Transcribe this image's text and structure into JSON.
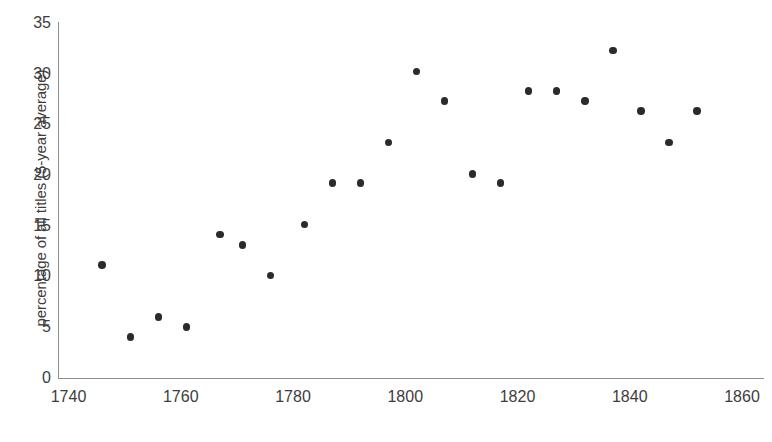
{
  "chart_data": {
    "type": "scatter",
    "title": "",
    "xlabel": "",
    "ylabel": "percentage of all titles (5-year average)",
    "xlim": [
      1740,
      1860
    ],
    "ylim": [
      0,
      35
    ],
    "xticks": [
      1740,
      1760,
      1780,
      1800,
      1820,
      1840,
      1860
    ],
    "xtick_labels": [
      "1740",
      "1760",
      "1780",
      "1800",
      "1820",
      "1840",
      "1860"
    ],
    "yticks": [
      0,
      5,
      10,
      15,
      20,
      25,
      30,
      35
    ],
    "ytick_labels": [
      "0",
      "5",
      "10",
      "15",
      "20",
      "25",
      "30",
      "35"
    ],
    "grid": false,
    "legend": false,
    "marker": "circle",
    "marker_color": "#2b2b2b",
    "axis_color": "#8e8e8e",
    "text_color": "#3d3d3d",
    "background": "#ffffff",
    "x": [
      1746,
      1751,
      1756,
      1761,
      1767,
      1771,
      1776,
      1782,
      1787,
      1792,
      1797,
      1802,
      1807,
      1812,
      1817,
      1822,
      1827,
      1832,
      1837,
      1842,
      1847,
      1852
    ],
    "y": [
      11.1,
      4.0,
      6.0,
      5.0,
      14.1,
      13.1,
      10.1,
      15.1,
      19.2,
      19.2,
      23.2,
      30.2,
      27.3,
      20.1,
      19.2,
      28.3,
      28.3,
      27.3,
      32.3,
      26.3,
      23.2,
      26.3
    ],
    "points": [
      {
        "x": 1746,
        "y": 11.1
      },
      {
        "x": 1751,
        "y": 4.0
      },
      {
        "x": 1756,
        "y": 6.0
      },
      {
        "x": 1761,
        "y": 5.0
      },
      {
        "x": 1767,
        "y": 14.1
      },
      {
        "x": 1771,
        "y": 13.1
      },
      {
        "x": 1776,
        "y": 10.1
      },
      {
        "x": 1782,
        "y": 15.1
      },
      {
        "x": 1787,
        "y": 19.2
      },
      {
        "x": 1792,
        "y": 19.2
      },
      {
        "x": 1797,
        "y": 23.2
      },
      {
        "x": 1802,
        "y": 30.2
      },
      {
        "x": 1807,
        "y": 27.3
      },
      {
        "x": 1812,
        "y": 20.1
      },
      {
        "x": 1817,
        "y": 19.2
      },
      {
        "x": 1822,
        "y": 28.3
      },
      {
        "x": 1827,
        "y": 28.3
      },
      {
        "x": 1832,
        "y": 27.3
      },
      {
        "x": 1837,
        "y": 32.3
      },
      {
        "x": 1842,
        "y": 26.3
      },
      {
        "x": 1847,
        "y": 23.2
      },
      {
        "x": 1852,
        "y": 26.3
      }
    ]
  }
}
